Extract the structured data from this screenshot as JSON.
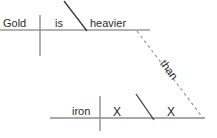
{
  "diagram": {
    "type": "reed-kellogg-sentence-diagram",
    "sentence": "Gold is heavier than iron.",
    "canvas": {
      "width": 217,
      "height": 138,
      "background": "#ffffff"
    },
    "colors": {
      "text": "#2b2b2b",
      "baseline": "#9a9a9a",
      "divider": "#8f8f8f",
      "slant": "#3a3a3a",
      "dashed": "#9b9b9b"
    },
    "main_clause": {
      "subject": "Gold",
      "verb": "is",
      "predicate_adjective": "heavier"
    },
    "subordinate_clause": {
      "subject": "iron",
      "verb_placeholder": "X",
      "complement_placeholder": "X"
    },
    "connector": "than",
    "labels": {
      "subject_top": "Gold",
      "verb_top": "is",
      "complement_top": "heavier",
      "subject_bottom": "iron",
      "slot_one": "X",
      "slot_two": "X",
      "conjunction": "than"
    }
  }
}
